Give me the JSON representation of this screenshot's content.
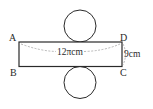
{
  "diagram": {
    "type": "cylinder-net",
    "vertices": {
      "A": "A",
      "B": "B",
      "C": "C",
      "D": "D"
    },
    "dimensions": {
      "length_label": "12πcm",
      "height_label": "9cm"
    },
    "colors": {
      "stroke": "#2a2a2a",
      "dashed": "#9a9a9a",
      "background": "#ffffff"
    }
  }
}
